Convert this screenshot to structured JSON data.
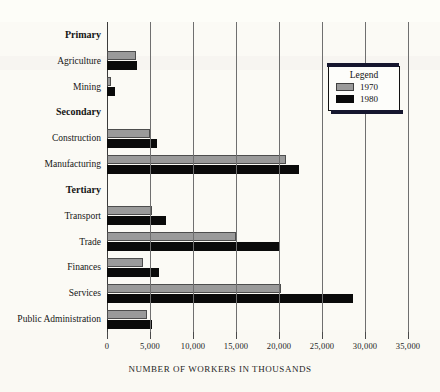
{
  "chart_data": {
    "type": "bar",
    "orientation": "horizontal",
    "title": "",
    "xlabel": "NUMBER OF WORKERS IN THOUSANDS",
    "ylabel": "",
    "xlim": [
      0,
      35000
    ],
    "xticks": [
      0,
      5000,
      10000,
      15000,
      20000,
      25000,
      30000,
      35000
    ],
    "xticklabels": [
      "0",
      "5,000",
      "10,000",
      "15,000",
      "20,000",
      "25,000",
      "30,000",
      "35,000"
    ],
    "grid": true,
    "grid_axis": "x",
    "legend": {
      "title": "Legend",
      "position": "top-right",
      "entries": [
        {
          "name": "1970",
          "color": "#9a9a9a"
        },
        {
          "name": "1980",
          "color": "#0a0a0a"
        }
      ]
    },
    "groups": [
      {
        "name": "Primary",
        "bold": true
      },
      {
        "name": "Secondary",
        "bold": true
      },
      {
        "name": "Tertiary",
        "bold": true
      }
    ],
    "categories": [
      "Agriculture",
      "Mining",
      "Construction",
      "Manufacturing",
      "Transport",
      "Trade",
      "Finances",
      "Services",
      "Public Administration"
    ],
    "series": [
      {
        "name": "1970",
        "color": "#9a9a9a",
        "values": [
          3400,
          500,
          5000,
          20800,
          5200,
          15000,
          4200,
          20200,
          4600
        ]
      },
      {
        "name": "1980",
        "color": "#0a0a0a",
        "values": [
          3500,
          900,
          5800,
          22300,
          6900,
          20100,
          6000,
          28600,
          5200
        ]
      }
    ]
  },
  "rows": [
    {
      "label": "Primary",
      "kind": "group"
    },
    {
      "label": "Agriculture",
      "kind": "bars",
      "i": 0
    },
    {
      "label": "Mining",
      "kind": "bars",
      "i": 1
    },
    {
      "label": "Secondary",
      "kind": "group"
    },
    {
      "label": "Construction",
      "kind": "bars",
      "i": 2
    },
    {
      "label": "Manufacturing",
      "kind": "bars",
      "i": 3
    },
    {
      "label": "Tertiary",
      "kind": "group"
    },
    {
      "label": "Transport",
      "kind": "bars",
      "i": 4
    },
    {
      "label": "Trade",
      "kind": "bars",
      "i": 5
    },
    {
      "label": "Finances",
      "kind": "bars",
      "i": 6
    },
    {
      "label": "Services",
      "kind": "bars",
      "i": 7
    },
    {
      "label": "Public Administration",
      "kind": "bars",
      "i": 8
    }
  ]
}
